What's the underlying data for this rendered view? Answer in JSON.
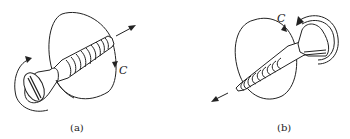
{
  "figure": {
    "panels": [
      {
        "id": "a",
        "caption": "(a)",
        "circle_label": "C",
        "description": "Screw with head at lower-left, tip pointing upper-right; rotation circle C around shank; arrow indicates advance direction toward upper-right",
        "advance_direction": "up-right"
      },
      {
        "id": "b",
        "caption": "(b)",
        "circle_label": "C",
        "description": "Screw with head at upper-right, tip pointing lower-left; rotation circle C around shank; arrow indicates advance direction toward lower-left",
        "advance_direction": "down-left"
      }
    ],
    "colors": {
      "line": "#222222",
      "background": "#ffffff"
    }
  }
}
